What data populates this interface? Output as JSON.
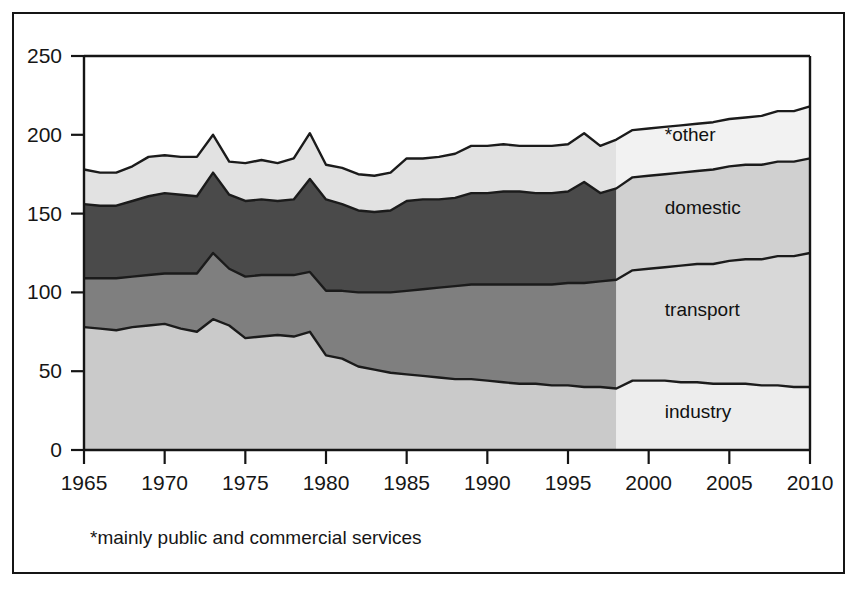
{
  "figure": {
    "footnote": "*mainly public and commercial services"
  },
  "chart_data": {
    "type": "area",
    "stacked": true,
    "title": "",
    "xlabel": "",
    "ylabel": "",
    "xlim": [
      1965,
      2010
    ],
    "ylim": [
      0,
      250
    ],
    "grid": false,
    "legend_position": "inline-band-labels",
    "forecast_start": 1998,
    "xticks": [
      1965,
      1970,
      1975,
      1980,
      1985,
      1990,
      1995,
      2000,
      2005,
      2010
    ],
    "yticks": [
      0,
      50,
      100,
      150,
      200,
      250
    ],
    "x": [
      1965,
      1966,
      1967,
      1968,
      1969,
      1970,
      1971,
      1972,
      1973,
      1974,
      1975,
      1976,
      1977,
      1978,
      1979,
      1980,
      1981,
      1982,
      1983,
      1984,
      1985,
      1986,
      1987,
      1988,
      1989,
      1990,
      1991,
      1992,
      1993,
      1994,
      1995,
      1996,
      1997,
      1998,
      1999,
      2000,
      2001,
      2002,
      2003,
      2004,
      2005,
      2006,
      2007,
      2008,
      2009,
      2010
    ],
    "series": [
      {
        "name": "industry",
        "label": "industry",
        "color": "#cacaca",
        "forecast_color": "#ededed",
        "values": [
          78,
          77,
          76,
          78,
          79,
          80,
          77,
          75,
          83,
          79,
          71,
          72,
          73,
          72,
          75,
          60,
          58,
          53,
          51,
          49,
          48,
          47,
          46,
          45,
          45,
          44,
          43,
          42,
          42,
          41,
          41,
          40,
          40,
          39,
          44,
          44,
          44,
          43,
          43,
          42,
          42,
          42,
          41,
          41,
          40,
          40
        ]
      },
      {
        "name": "transport",
        "label": "transport",
        "color": "#7f7f7f",
        "forecast_color": "#d8d8d8",
        "values": [
          31,
          32,
          33,
          32,
          32,
          32,
          35,
          37,
          42,
          36,
          39,
          39,
          38,
          39,
          38,
          41,
          43,
          47,
          49,
          51,
          53,
          55,
          57,
          59,
          60,
          61,
          62,
          63,
          63,
          64,
          65,
          66,
          67,
          69,
          70,
          71,
          72,
          74,
          75,
          76,
          78,
          79,
          80,
          82,
          83,
          85
        ]
      },
      {
        "name": "domestic",
        "label": "domestic",
        "color": "#4a4a4a",
        "forecast_color": "#d0d0d0",
        "values": [
          47,
          46,
          46,
          48,
          50,
          51,
          50,
          49,
          51,
          47,
          48,
          48,
          47,
          48,
          59,
          58,
          55,
          52,
          51,
          52,
          57,
          57,
          56,
          56,
          58,
          58,
          59,
          59,
          58,
          58,
          58,
          64,
          56,
          58,
          59,
          59,
          59,
          59,
          59,
          60,
          60,
          60,
          60,
          60,
          60,
          60
        ]
      },
      {
        "name": "*other",
        "label": "*other",
        "color": "#e2e2e2",
        "forecast_color": "#f2f2f2",
        "values": [
          22,
          21,
          21,
          22,
          25,
          24,
          24,
          25,
          24,
          21,
          24,
          25,
          24,
          26,
          29,
          22,
          23,
          23,
          23,
          24,
          27,
          26,
          27,
          28,
          30,
          30,
          30,
          29,
          30,
          30,
          30,
          31,
          30,
          31,
          30,
          30,
          30,
          30,
          30,
          30,
          30,
          30,
          31,
          32,
          32,
          33
        ]
      }
    ],
    "band_label_positions": [
      {
        "name": "industry",
        "x": 2001,
        "y": 20
      },
      {
        "name": "transport",
        "x": 2001,
        "y": 85
      },
      {
        "name": "domestic",
        "x": 2001,
        "y": 150
      },
      {
        "name": "*other",
        "x": 2001,
        "y": 196
      }
    ]
  }
}
